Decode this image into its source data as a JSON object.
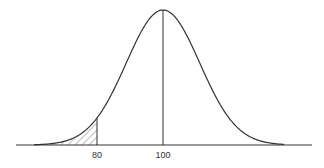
{
  "diagram": {
    "type": "normal-distribution-curve",
    "mean": 100,
    "shaded_region": "left tail below 80",
    "tick_labels": [
      "80",
      "100"
    ],
    "colors": {
      "stroke": "#333333",
      "hatch": "#555555",
      "background": "#ffffff"
    }
  },
  "ticks": {
    "t80": "80",
    "t100": "100"
  }
}
